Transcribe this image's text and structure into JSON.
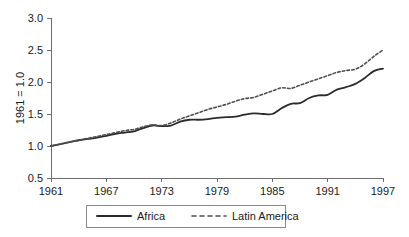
{
  "chart_data": {
    "type": "line",
    "title": "",
    "xlabel": "",
    "ylabel": "1961 = 1.0",
    "xlim": [
      1961,
      1997
    ],
    "ylim": [
      0.5,
      3.0
    ],
    "ytick_labels": [
      "3.0",
      "2.5",
      "2.0",
      "1.5",
      "1.0",
      "0.5"
    ],
    "ytick_values": [
      3.0,
      2.5,
      2.0,
      1.5,
      1.0,
      0.5
    ],
    "xtick_labels": [
      "1961",
      "1967",
      "1973",
      "1979",
      "1985",
      "1991",
      "1997"
    ],
    "xtick_values": [
      1961,
      1967,
      1973,
      1979,
      1985,
      1991,
      1997
    ],
    "grid": false,
    "legend_position": "bottom",
    "x": [
      1961,
      1962,
      1963,
      1964,
      1965,
      1966,
      1967,
      1968,
      1969,
      1970,
      1971,
      1972,
      1973,
      1974,
      1975,
      1976,
      1977,
      1978,
      1979,
      1980,
      1981,
      1982,
      1983,
      1984,
      1985,
      1986,
      1987,
      1988,
      1989,
      1990,
      1991,
      1992,
      1993,
      1994,
      1995,
      1996,
      1997
    ],
    "series": [
      {
        "name": "Africa",
        "style": "solid",
        "color": "#2b2b2b",
        "values": [
          1.0,
          1.03,
          1.06,
          1.09,
          1.11,
          1.13,
          1.16,
          1.19,
          1.21,
          1.23,
          1.28,
          1.32,
          1.31,
          1.32,
          1.38,
          1.41,
          1.41,
          1.42,
          1.44,
          1.45,
          1.46,
          1.49,
          1.51,
          1.5,
          1.5,
          1.59,
          1.66,
          1.67,
          1.75,
          1.79,
          1.8,
          1.88,
          1.92,
          1.97,
          2.06,
          2.17,
          2.21
        ]
      },
      {
        "name": "Latin America",
        "style": "dashed",
        "color": "#4f4f4f",
        "values": [
          1.0,
          1.03,
          1.06,
          1.09,
          1.12,
          1.15,
          1.18,
          1.21,
          1.24,
          1.26,
          1.3,
          1.33,
          1.32,
          1.36,
          1.42,
          1.47,
          1.52,
          1.57,
          1.61,
          1.65,
          1.7,
          1.74,
          1.76,
          1.81,
          1.86,
          1.91,
          1.9,
          1.95,
          2.0,
          2.05,
          2.1,
          2.15,
          2.18,
          2.2,
          2.28,
          2.4,
          2.5
        ]
      }
    ]
  },
  "legend": {
    "items": [
      {
        "label": "Africa",
        "style": "solid"
      },
      {
        "label": "Latin America",
        "style": "dashed"
      }
    ]
  }
}
